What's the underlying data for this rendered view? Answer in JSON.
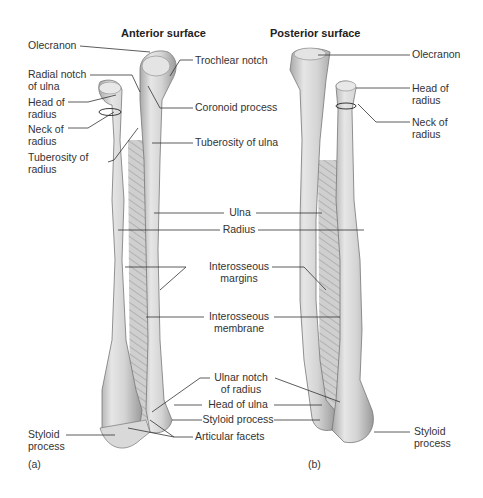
{
  "figure": {
    "panel_a": {
      "title": "Anterior surface",
      "tag": "(a)",
      "labels": {
        "olecranon": "Olecranon",
        "radial_notch": "Radial notch\nof ulna",
        "head_of_radius": "Head of\nradius",
        "neck_of_radius": "Neck of\nradius",
        "tuberosity_of_radius": "Tuberosity of\nradius",
        "trochlear_notch": "Trochlear notch",
        "coronoid_process": "Coronoid process",
        "tuberosity_of_ulna": "Tuberosity of ulna",
        "styloid_process_left": "Styloid\nprocess",
        "articular_facets": "Articular facets"
      }
    },
    "panel_b": {
      "title": "Posterior surface",
      "tag": "(b)",
      "labels": {
        "olecranon": "Olecranon",
        "head_of_radius": "Head of\nradius",
        "neck_of_radius": "Neck of\nradius",
        "styloid_process_right": "Styloid\nprocess"
      }
    },
    "shared_labels": {
      "ulna": "Ulna",
      "radius": "Radius",
      "interosseous_margins": "Interosseous\nmargins",
      "interosseous_membrane": "Interosseous\nmembrane",
      "ulnar_notch": "Ulnar notch\nof radius",
      "head_of_ulna": "Head of ulna",
      "styloid_process_mid": "Styloid process"
    }
  }
}
